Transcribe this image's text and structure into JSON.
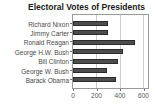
{
  "title": "Electoral Votes of Presidents",
  "chart_data": {
    "type": "bar",
    "orientation": "horizontal",
    "title": "Electoral Votes of Presidents",
    "categories": [
      "Richard Nixon",
      "Jimmy Carter",
      "Ronald Reagan",
      "George H.W. Bush",
      "Bill Clinton",
      "George W. Bush",
      "Barack Obama"
    ],
    "values": [
      301,
      297,
      525,
      426,
      379,
      286,
      365
    ],
    "xlabel": "",
    "ylabel": "",
    "xlim": [
      0,
      640
    ],
    "xticks": [
      0,
      200,
      400,
      600
    ],
    "grid": true,
    "legend": "none",
    "colors": {
      "bar_fill": "#4d4d4d",
      "bar_border": "#2b2b2b",
      "grid": "#cccccc",
      "axis": "#9a9a9a",
      "tick": "#777777",
      "category_label": "#4a4a4a",
      "tick_label": "#555555",
      "title": "#1a1a1a",
      "background": "#ffffff"
    }
  }
}
